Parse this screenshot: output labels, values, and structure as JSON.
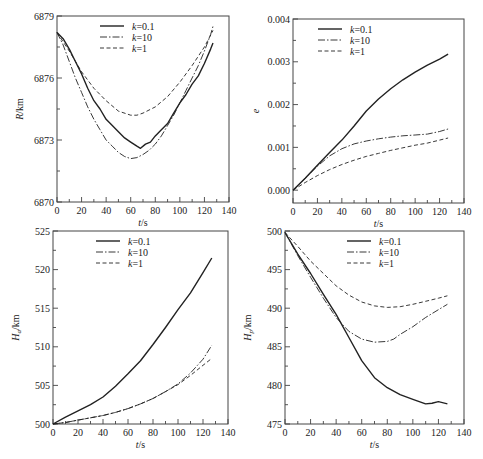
{
  "chart_data": [
    {
      "type": "line",
      "panel": "top-left",
      "title": "",
      "xlabel": "t/s",
      "ylabel": "R/km",
      "xlim": [
        0,
        140
      ],
      "ylim": [
        6870,
        6879
      ],
      "xticks": [
        0,
        20,
        40,
        60,
        80,
        100,
        120,
        140
      ],
      "yticks": [
        6870,
        6873,
        6876,
        6879
      ],
      "grid": false,
      "legend": "top-center",
      "series": [
        {
          "name": "k=0.1",
          "style": "solid",
          "x": [
            0,
            5,
            10,
            15,
            20,
            25,
            30,
            35,
            40,
            45,
            50,
            55,
            60,
            65,
            68,
            72,
            76,
            80,
            85,
            90,
            95,
            100,
            105,
            110,
            115,
            120,
            125,
            127
          ],
          "y": [
            6878.2,
            6877.9,
            6877.4,
            6876.8,
            6876.2,
            6875.5,
            6874.9,
            6874.5,
            6874.0,
            6873.7,
            6873.4,
            6873.1,
            6872.9,
            6872.7,
            6872.6,
            6872.8,
            6872.9,
            6873.2,
            6873.5,
            6873.8,
            6874.3,
            6874.8,
            6875.2,
            6875.7,
            6876.1,
            6876.7,
            6877.4,
            6877.7
          ]
        },
        {
          "name": "k=10",
          "style": "dashdot",
          "x": [
            0,
            5,
            10,
            15,
            20,
            25,
            30,
            35,
            40,
            45,
            50,
            55,
            60,
            65,
            70,
            75,
            80,
            85,
            90,
            95,
            100,
            105,
            110,
            115,
            120,
            125,
            127
          ],
          "y": [
            6878.2,
            6877.6,
            6876.8,
            6876.0,
            6875.3,
            6874.6,
            6874.0,
            6873.5,
            6873.0,
            6872.7,
            6872.4,
            6872.2,
            6872.1,
            6872.15,
            6872.3,
            6872.5,
            6872.8,
            6873.2,
            6873.7,
            6874.2,
            6874.8,
            6875.4,
            6876.0,
            6876.6,
            6877.3,
            6878.1,
            6878.5
          ]
        },
        {
          "name": "k=1",
          "style": "dashed",
          "x": [
            0,
            10,
            20,
            30,
            40,
            50,
            60,
            65,
            70,
            80,
            90,
            100,
            110,
            120,
            127
          ],
          "y": [
            6878.2,
            6877.3,
            6876.3,
            6875.5,
            6874.9,
            6874.4,
            6874.2,
            6874.2,
            6874.3,
            6874.6,
            6875.1,
            6875.8,
            6876.6,
            6877.5,
            6878.3
          ]
        }
      ]
    },
    {
      "type": "line",
      "panel": "top-right",
      "title": "",
      "xlabel": "t/s",
      "ylabel": "e",
      "xlim": [
        0,
        140
      ],
      "ylim": [
        -0.0003,
        0.004
      ],
      "xticks": [
        0,
        20,
        40,
        60,
        80,
        100,
        120,
        140
      ],
      "yticks": [
        0.0,
        0.001,
        0.002,
        0.003,
        0.004
      ],
      "ytick_labels": [
        "0.000",
        "0.001",
        "0.002",
        "0.003",
        "0.004"
      ],
      "grid": false,
      "legend": "top-left",
      "series": [
        {
          "name": "k=0.1",
          "style": "solid",
          "x": [
            0,
            10,
            20,
            30,
            40,
            50,
            60,
            70,
            80,
            90,
            100,
            110,
            120,
            127
          ],
          "y": [
            0.0,
            0.00028,
            0.00058,
            0.00088,
            0.00117,
            0.0015,
            0.00185,
            0.00213,
            0.00237,
            0.00258,
            0.00276,
            0.00292,
            0.00306,
            0.00318
          ]
        },
        {
          "name": "k=10",
          "style": "dashdot",
          "x": [
            0,
            10,
            20,
            30,
            40,
            50,
            60,
            70,
            80,
            90,
            100,
            110,
            120,
            127
          ],
          "y": [
            0.0,
            0.00028,
            0.00056,
            0.0008,
            0.00097,
            0.00108,
            0.00115,
            0.0012,
            0.00124,
            0.00127,
            0.00129,
            0.00131,
            0.00137,
            0.00143
          ]
        },
        {
          "name": "k=1",
          "style": "dashed",
          "x": [
            0,
            10,
            20,
            30,
            40,
            50,
            60,
            70,
            80,
            90,
            100,
            110,
            120,
            127
          ],
          "y": [
            0.0,
            0.00018,
            0.00034,
            0.00048,
            0.0006,
            0.0007,
            0.00079,
            0.00086,
            0.00093,
            0.00099,
            0.00105,
            0.0011,
            0.00117,
            0.00122
          ]
        }
      ]
    },
    {
      "type": "line",
      "panel": "bottom-left",
      "title": "",
      "xlabel": "t/s",
      "ylabel": "H_a/km",
      "xlim": [
        0,
        140
      ],
      "ylim": [
        500,
        525
      ],
      "xticks": [
        0,
        20,
        40,
        60,
        80,
        100,
        120,
        140
      ],
      "yticks": [
        500,
        505,
        510,
        515,
        520,
        525
      ],
      "grid": false,
      "legend": "top-center",
      "series": [
        {
          "name": "k=0.1",
          "style": "solid",
          "x": [
            0,
            10,
            20,
            30,
            40,
            50,
            60,
            70,
            80,
            90,
            100,
            110,
            120,
            127
          ],
          "y": [
            500.0,
            500.9,
            501.7,
            502.5,
            503.5,
            504.9,
            506.5,
            508.2,
            510.3,
            512.5,
            514.8,
            517.0,
            519.6,
            521.5
          ]
        },
        {
          "name": "k=10",
          "style": "dashdot",
          "x": [
            0,
            10,
            20,
            30,
            40,
            50,
            60,
            70,
            80,
            90,
            100,
            110,
            120,
            127
          ],
          "y": [
            500.0,
            500.2,
            500.5,
            500.8,
            501.1,
            501.5,
            502.0,
            502.6,
            503.3,
            504.2,
            505.2,
            506.6,
            508.4,
            510.2
          ]
        },
        {
          "name": "k=1",
          "style": "dashed",
          "x": [
            0,
            10,
            20,
            30,
            40,
            50,
            60,
            70,
            80,
            90,
            100,
            110,
            120,
            127
          ],
          "y": [
            500.0,
            500.2,
            500.5,
            500.8,
            501.1,
            501.5,
            502.0,
            502.6,
            503.3,
            504.2,
            505.1,
            506.3,
            507.6,
            508.5
          ]
        }
      ]
    },
    {
      "type": "line",
      "panel": "bottom-right",
      "title": "",
      "xlabel": "t/s",
      "ylabel": "H_p/km",
      "xlim": [
        0,
        140
      ],
      "ylim": [
        475,
        500
      ],
      "xticks": [
        0,
        20,
        40,
        60,
        80,
        100,
        120,
        140
      ],
      "yticks": [
        475,
        480,
        485,
        490,
        495,
        500
      ],
      "grid": false,
      "legend": "top-center",
      "series": [
        {
          "name": "k=0.1",
          "style": "solid",
          "x": [
            0,
            10,
            20,
            30,
            40,
            50,
            60,
            70,
            80,
            90,
            100,
            110,
            115,
            120,
            127
          ],
          "y": [
            499.8,
            497.0,
            494.5,
            491.8,
            489.2,
            486.2,
            483.2,
            481.0,
            479.7,
            478.8,
            478.2,
            477.6,
            477.7,
            477.9,
            477.6
          ]
        },
        {
          "name": "k=10",
          "style": "dashdot",
          "x": [
            0,
            10,
            20,
            30,
            40,
            50,
            60,
            70,
            80,
            85,
            90,
            100,
            110,
            120,
            127
          ],
          "y": [
            499.8,
            496.8,
            494.0,
            491.3,
            488.8,
            487.0,
            486.0,
            485.6,
            485.7,
            486.0,
            486.6,
            487.6,
            488.8,
            489.8,
            490.5
          ]
        },
        {
          "name": "k=1",
          "style": "dashed",
          "x": [
            0,
            10,
            20,
            30,
            40,
            50,
            60,
            70,
            80,
            90,
            100,
            110,
            120,
            127
          ],
          "y": [
            499.8,
            498.0,
            496.1,
            494.5,
            492.9,
            491.7,
            490.8,
            490.3,
            490.1,
            490.2,
            490.5,
            490.9,
            491.3,
            491.6
          ]
        }
      ]
    }
  ]
}
